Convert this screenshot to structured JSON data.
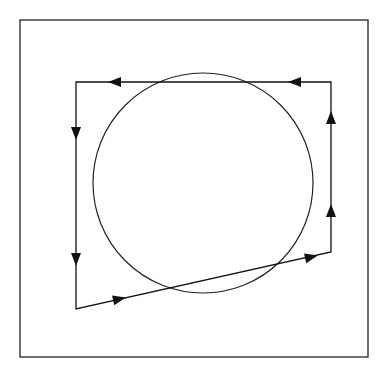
{
  "diagram": {
    "type": "closed-path-around-circle",
    "frame": {
      "x": 20,
      "y": 20,
      "width": 348,
      "height": 337,
      "stroke": "#222222"
    },
    "circle": {
      "cx": 203,
      "cy": 183,
      "r": 110,
      "stroke": "#222222"
    },
    "path": {
      "vertices": [
        [
          331,
          82
        ],
        [
          76,
          82
        ],
        [
          76,
          309
        ],
        [
          331,
          252
        ]
      ],
      "stroke": "#111111",
      "direction": "counterclockwise"
    },
    "arrows": [
      {
        "x": 115,
        "y": 82,
        "dir": "left"
      },
      {
        "x": 295,
        "y": 82,
        "dir": "left"
      },
      {
        "x": 76,
        "y": 133,
        "dir": "down"
      },
      {
        "x": 76,
        "y": 259,
        "dir": "down"
      },
      {
        "x": 119,
        "y": 299,
        "dir": "right-up"
      },
      {
        "x": 311,
        "y": 257,
        "dir": "right-up"
      },
      {
        "x": 331,
        "y": 211,
        "dir": "up"
      },
      {
        "x": 331,
        "y": 118,
        "dir": "up"
      }
    ]
  }
}
